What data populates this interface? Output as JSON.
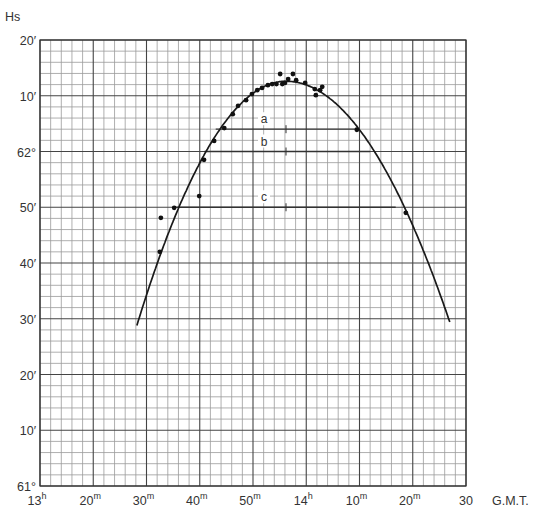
{
  "chart_data": {
    "type": "scatter",
    "title": "",
    "ylabel": "Hs",
    "xlabel": "G.M.T.",
    "x_units": "minutes after 13h00m",
    "y_units": "arcminutes above 61°00'",
    "xlim": [
      10,
      90
    ],
    "ylim": [
      0,
      80
    ],
    "grid": true,
    "x_ticks": [
      {
        "value": 10,
        "label": "13",
        "sup": "h"
      },
      {
        "value": 20,
        "label": "20",
        "sup": "m"
      },
      {
        "value": 30,
        "label": "30",
        "sup": "m"
      },
      {
        "value": 40,
        "label": "40",
        "sup": "m"
      },
      {
        "value": 50,
        "label": "50",
        "sup": "m"
      },
      {
        "value": 60,
        "label": "14",
        "sup": "h"
      },
      {
        "value": 70,
        "label": "10",
        "sup": "m"
      },
      {
        "value": 80,
        "label": "20",
        "sup": "m"
      },
      {
        "value": 90,
        "label": "30",
        "sup": ""
      }
    ],
    "y_ticks": [
      {
        "value": 0,
        "label": "61°"
      },
      {
        "value": 10,
        "label": "10′"
      },
      {
        "value": 20,
        "label": "20′"
      },
      {
        "value": 30,
        "label": "30′"
      },
      {
        "value": 40,
        "label": "40′"
      },
      {
        "value": 50,
        "label": "50′"
      },
      {
        "value": 60,
        "label": "62°"
      },
      {
        "value": 70,
        "label": "10′"
      },
      {
        "value": 80,
        "label": "20′"
      }
    ],
    "series": [
      {
        "name": "observations",
        "type": "scatter",
        "points": [
          [
            32.5,
            42.0
          ],
          [
            32.7,
            48.1
          ],
          [
            35.2,
            49.9
          ],
          [
            39.9,
            52.0
          ],
          [
            40.8,
            58.5
          ],
          [
            42.7,
            61.9
          ],
          [
            44.6,
            64.2
          ],
          [
            46.2,
            66.7
          ],
          [
            47.2,
            68.2
          ],
          [
            48.7,
            69.2
          ],
          [
            49.8,
            70.3
          ],
          [
            50.8,
            71.0
          ],
          [
            51.7,
            71.4
          ],
          [
            52.8,
            71.9
          ],
          [
            53.6,
            72.1
          ],
          [
            54.4,
            72.1
          ],
          [
            55.1,
            73.9
          ],
          [
            55.5,
            72.1
          ],
          [
            56.0,
            72.3
          ],
          [
            56.6,
            73.0
          ],
          [
            57.5,
            73.9
          ],
          [
            58.1,
            72.8
          ],
          [
            59.8,
            72.3
          ],
          [
            61.6,
            71.2
          ],
          [
            61.8,
            70.1
          ],
          [
            62.6,
            71.0
          ],
          [
            63.0,
            71.6
          ],
          [
            69.5,
            63.9
          ],
          [
            78.7,
            49.0
          ]
        ]
      },
      {
        "name": "fitted curve",
        "type": "line",
        "vertex": [
          56.2,
          72.6
        ],
        "endpoints": [
          [
            28.2,
            28.8
          ],
          [
            87.1,
            29.0
          ]
        ]
      }
    ],
    "annotations": [
      {
        "label": "a",
        "y": 64.0,
        "x_from": 43.0,
        "x_to": 69.4,
        "mid_tick_x": 56.2
      },
      {
        "label": "b",
        "y": 60.0,
        "x_from": 40.9,
        "x_to": 72.0,
        "mid_tick_x": 56.2
      },
      {
        "label": "c",
        "y": 50.0,
        "x_from": 35.6,
        "x_to": 76.8,
        "mid_tick_x": 56.2
      }
    ]
  }
}
